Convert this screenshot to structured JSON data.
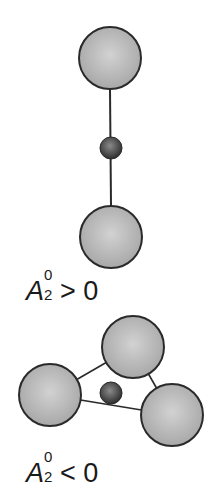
{
  "figure": {
    "panels": [
      {
        "id": "positive",
        "description": "Linear (axial) arrangement: two large ions above and below a small central ion",
        "label": {
          "symbol": "A",
          "superscript": "0",
          "subscript": "2",
          "relation": "> 0"
        }
      },
      {
        "id": "negative",
        "description": "Triangular (planar) arrangement: three large ions around a small central ion",
        "label": {
          "symbol": "A",
          "superscript": "0",
          "subscript": "2",
          "relation": "< 0"
        }
      }
    ],
    "colors": {
      "large_sphere_light": "#d2d2d2",
      "large_sphere_dark": "#a8a8a8",
      "small_sphere_light": "#8a8a8a",
      "small_sphere_dark": "#2e2e2e",
      "outline": "#2a2a2a",
      "bond": "#2a2a2a"
    }
  }
}
